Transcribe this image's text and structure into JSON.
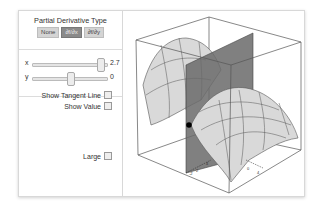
{
  "controls": {
    "derivative_type": {
      "title": "Partial Derivative Type",
      "options": [
        "None",
        "∂f/∂x",
        "∂f/∂y"
      ],
      "selected": 1
    },
    "sliders": [
      {
        "label": "x",
        "value": "2.7",
        "position": 0.9
      },
      {
        "label": "y",
        "value": "0",
        "position": 0.5
      }
    ],
    "checkboxes": {
      "show_tangent_line": {
        "label": "Show Tangent Line",
        "checked": false
      },
      "show_value": {
        "label": "Show Value",
        "checked": false
      },
      "large": {
        "label": "Large",
        "checked": false
      }
    }
  },
  "plot": {
    "description": "3D saddle surface f(x,y) with vertical cutting plane at x=2.7 and point on surface",
    "axis_tick_labels_front": [
      "-2",
      "2",
      "4"
    ],
    "axis_tick_labels_right": [
      "0",
      "4"
    ],
    "colors": {
      "surface": "#d9d9d9",
      "mesh": "#555555",
      "plane": "#6a6a6a",
      "box": "#555555",
      "point": "#000000"
    }
  }
}
